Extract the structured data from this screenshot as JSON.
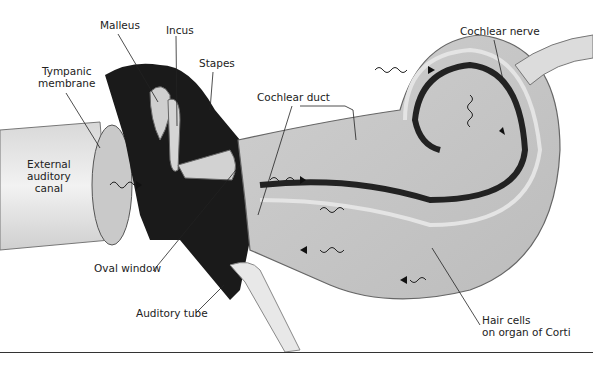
{
  "diagram": {
    "labels": {
      "malleus": "Malleus",
      "incus": "Incus",
      "stapes": "Stapes",
      "tympanic_line1": "Tympanic",
      "tympanic_line2": "membrane",
      "external_line1": "External",
      "external_line2": "auditory",
      "external_line3": "canal",
      "cochlear_duct": "Cochlear duct",
      "cochlear_nerve": "Cochlear nerve",
      "oval_window": "Oval window",
      "auditory_tube": "Auditory tube",
      "hair_cells_line1": "Hair cells",
      "hair_cells_line2": "on organ of Corti"
    },
    "colors": {
      "ossicle_dark": "#1a1a1a",
      "tissue_gray": "#bdbdbd",
      "tissue_light": "#e6e6e6",
      "outline": "#555555",
      "leader": "#222222"
    }
  }
}
